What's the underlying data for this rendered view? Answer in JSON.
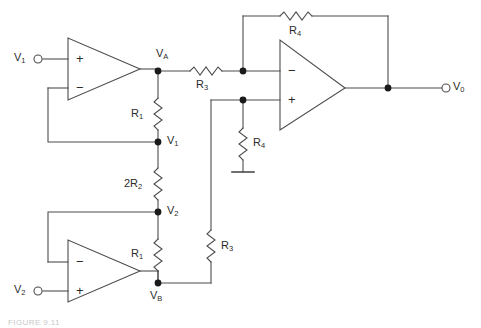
{
  "figure": {
    "caption": "FIGURE 9.11",
    "stroke_color": "#4d4d4d",
    "text_color": "#2b2b2b",
    "background": "#ffffff"
  },
  "terminals": [
    {
      "name": "input-v1",
      "label": "V",
      "sub": "1",
      "x": 18,
      "y": 59
    },
    {
      "name": "input-v2",
      "label": "V",
      "sub": "2",
      "x": 18,
      "y": 291
    },
    {
      "name": "output-v0",
      "label": "V",
      "sub": "0",
      "x": 458,
      "y": 88
    }
  ],
  "nodes": [
    {
      "name": "node-va",
      "label": "V",
      "sub": "A",
      "x": 158,
      "y": 71
    },
    {
      "name": "node-v1",
      "label": "V",
      "sub": "1",
      "x": 158,
      "y": 142
    },
    {
      "name": "node-v2",
      "label": "V",
      "sub": "2",
      "x": 158,
      "y": 212
    },
    {
      "name": "node-vb",
      "label": "V",
      "sub": "B",
      "x": 158,
      "y": 283
    }
  ],
  "resistors": [
    {
      "name": "resistor-r1-upper",
      "label": "R",
      "sub": "1",
      "orientation": "vertical",
      "between": "VA-V1"
    },
    {
      "name": "resistor-2r2",
      "label": "2R",
      "sub": "2",
      "orientation": "vertical",
      "between": "V1-V2"
    },
    {
      "name": "resistor-r1-lower",
      "label": "R",
      "sub": "1",
      "orientation": "vertical",
      "between": "V2-VB"
    },
    {
      "name": "resistor-r3-upper",
      "label": "R",
      "sub": "3",
      "orientation": "horizontal",
      "between": "VA-inverting-input"
    },
    {
      "name": "resistor-r3-lower",
      "label": "R",
      "sub": "3",
      "orientation": "vertical",
      "between": "VB-noninverting-input"
    },
    {
      "name": "resistor-r4-feedback",
      "label": "R",
      "sub": "4",
      "orientation": "horizontal",
      "between": "inverting-input-output"
    },
    {
      "name": "resistor-r4-ground",
      "label": "R",
      "sub": "4",
      "orientation": "vertical",
      "between": "noninverting-input-ground"
    }
  ],
  "opamps": [
    {
      "name": "opamp-top",
      "plus": "+",
      "minus": "−",
      "plus_on_top": true,
      "input_signal": "V1"
    },
    {
      "name": "opamp-bottom",
      "plus": "+",
      "minus": "−",
      "plus_on_top": false,
      "input_signal": "V2"
    },
    {
      "name": "opamp-output",
      "plus": "+",
      "minus": "−",
      "plus_on_top": false,
      "input_signal": "difference"
    }
  ],
  "ground": {
    "name": "ground-symbol",
    "x": 243,
    "y": 172
  }
}
